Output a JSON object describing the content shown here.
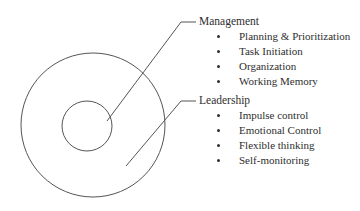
{
  "diagram": {
    "stroke_color": "#555555",
    "background_color": "#ffffff",
    "text_color": "#2e2e2e",
    "shapes": {
      "outer_circle": {
        "name": "outer-circle",
        "cx": 93,
        "cy": 125,
        "r": 72
      },
      "inner_circle": {
        "name": "inner-circle",
        "cx": 87,
        "cy": 126,
        "r": 25
      }
    },
    "leader_lines": [
      {
        "name": "management-leader-line",
        "points": "107,121 181,22 196,22"
      },
      {
        "name": "leadership-leader-line",
        "points": "126,166 181,101 196,101"
      }
    ]
  },
  "groups": [
    {
      "id": "management",
      "heading": "Management",
      "items": [
        "Planning & Prioritization",
        "Task Initiation",
        "Organization",
        "Working Memory"
      ]
    },
    {
      "id": "leadership",
      "heading": "Leadership",
      "items": [
        "Impulse control",
        "Emotional Control",
        "Flexible thinking",
        "Self-monitoring"
      ]
    }
  ]
}
